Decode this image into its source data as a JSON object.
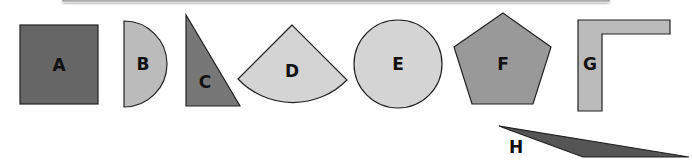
{
  "figure": {
    "shapes": [
      {
        "id": "A",
        "label": "A",
        "type": "square",
        "fill": "#666666"
      },
      {
        "id": "B",
        "label": "B",
        "type": "semicircle",
        "fill": "#bbbbbb"
      },
      {
        "id": "C",
        "label": "C",
        "type": "right-triangle",
        "fill": "#777777"
      },
      {
        "id": "D",
        "label": "D",
        "type": "circular-sector",
        "fill": "#d4d4d4"
      },
      {
        "id": "E",
        "label": "E",
        "type": "circle",
        "fill": "#d4d4d4"
      },
      {
        "id": "F",
        "label": "F",
        "type": "pentagon",
        "fill": "#999999"
      },
      {
        "id": "G",
        "label": "G",
        "type": "l-shape",
        "fill": "#bbbbbb"
      },
      {
        "id": "H",
        "label": "H",
        "type": "obtuse-triangle",
        "fill": "#555555"
      }
    ]
  }
}
